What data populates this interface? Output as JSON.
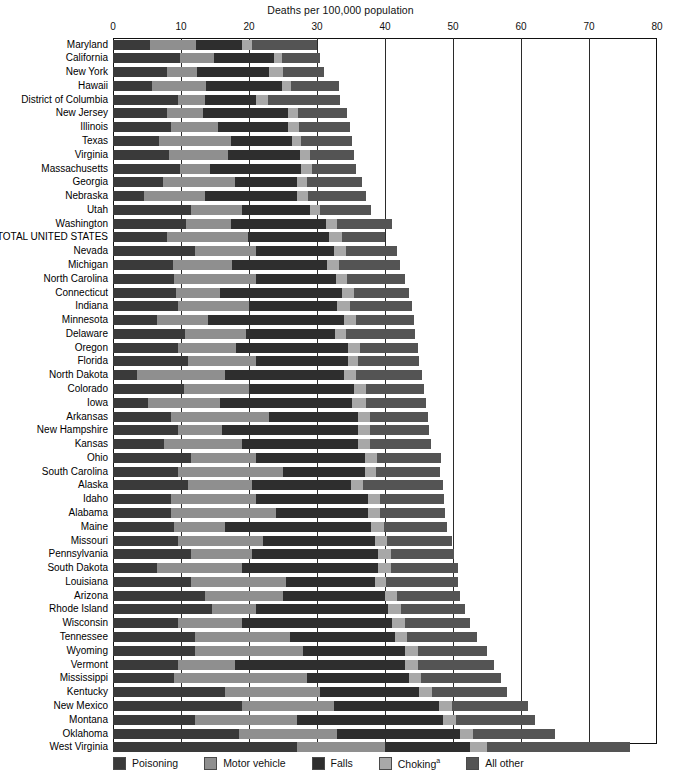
{
  "chart_data": {
    "type": "bar",
    "orientation": "horizontal",
    "stacked": true,
    "title": "Deaths per 100,000 population",
    "xlabel": "Deaths per 100,000 population",
    "ylabel": "",
    "xlim": [
      0,
      80
    ],
    "xticks": [
      0,
      10,
      20,
      30,
      40,
      50,
      60,
      70,
      80
    ],
    "grid": "vertical",
    "legend_position": "bottom",
    "legend": [
      {
        "name": "Poisoning",
        "color": "#3a3a3a"
      },
      {
        "name": "Motor vehicle",
        "color": "#8f8f8f"
      },
      {
        "name": "Falls",
        "color": "#2e2e2e"
      },
      {
        "name": "Choking",
        "color": "#a8a8a8",
        "footnote": "a"
      },
      {
        "name": "All other",
        "color": "#545454"
      }
    ],
    "series": [
      {
        "name": "Poisoning",
        "color": "#3a3a3a"
      },
      {
        "name": "Motor vehicle",
        "color": "#8f8f8f"
      },
      {
        "name": "Falls",
        "color": "#2e2e2e"
      },
      {
        "name": "Choking",
        "color": "#a8a8a8"
      },
      {
        "name": "All other",
        "color": "#545454"
      }
    ],
    "categories": [
      "Maryland",
      "California",
      "New York",
      "Hawaii",
      "District of Columbia",
      "New Jersey",
      "Illinois",
      "Texas",
      "Virginia",
      "Massachusetts",
      "Georgia",
      "Nebraska",
      "Utah",
      "Washington",
      "TOTAL UNITED STATES",
      "Nevada",
      "Michigan",
      "North Carolina",
      "Connecticut",
      "Indiana",
      "Minnesota",
      "Delaware",
      "Oregon",
      "Florida",
      "North Dakota",
      "Colorado",
      "Iowa",
      "Arkansas",
      "New Hampshire",
      "Kansas",
      "Ohio",
      "South Carolina",
      "Alaska",
      "Idaho",
      "Alabama",
      "Maine",
      "Missouri",
      "Pennsylvania",
      "South Dakota",
      "Louisiana",
      "Arizona",
      "Rhode Island",
      "Wisconsin",
      "Tennessee",
      "Wyoming",
      "Vermont",
      "Mississippi",
      "Kentucky",
      "New Mexico",
      "Montana",
      "Oklahoma",
      "West Virginia"
    ],
    "rows": [
      {
        "state": "Maryland",
        "values": [
          5.4,
          6.8,
          6.8,
          1.5,
          9.5
        ],
        "total": 30.0
      },
      {
        "state": "California",
        "values": [
          9.9,
          4.9,
          8.9,
          1.2,
          5.6
        ],
        "total": 30.5
      },
      {
        "state": "New York",
        "values": [
          8.0,
          4.3,
          10.7,
          2.0,
          6.0
        ],
        "total": 31.0
      },
      {
        "state": "Hawaii",
        "values": [
          5.7,
          8.0,
          11.2,
          1.3,
          7.0
        ],
        "total": 33.2
      },
      {
        "state": "District of Columbia",
        "values": [
          9.5,
          4.0,
          7.5,
          1.8,
          10.6
        ],
        "total": 33.4
      },
      {
        "state": "New Jersey",
        "values": [
          7.9,
          5.4,
          12.5,
          1.4,
          7.2
        ],
        "total": 34.4
      },
      {
        "state": "Illinois",
        "values": [
          8.5,
          7.0,
          10.2,
          1.6,
          7.5
        ],
        "total": 34.8
      },
      {
        "state": "Texas",
        "values": [
          6.8,
          10.5,
          9.0,
          1.3,
          7.6
        ],
        "total": 35.2
      },
      {
        "state": "Virginia",
        "values": [
          8.2,
          8.7,
          10.6,
          1.5,
          6.5
        ],
        "total": 35.5
      },
      {
        "state": "Massachusetts",
        "values": [
          9.8,
          4.5,
          13.4,
          1.6,
          6.5
        ],
        "total": 35.8
      },
      {
        "state": "Georgia",
        "values": [
          7.4,
          10.5,
          9.2,
          1.5,
          8.0
        ],
        "total": 36.6
      },
      {
        "state": "Nebraska",
        "values": [
          4.5,
          9.0,
          13.5,
          1.7,
          8.5
        ],
        "total": 37.2
      },
      {
        "state": "Utah",
        "values": [
          11.5,
          7.5,
          10.0,
          1.5,
          7.5
        ],
        "total": 38.0
      },
      {
        "state": "Washington",
        "values": [
          10.8,
          6.5,
          14.0,
          1.6,
          8.2
        ],
        "total": 41.1
      },
      {
        "state": "TOTAL UNITED STATES",
        "values": [
          8.0,
          11.8,
          12.0,
          1.9,
          6.3
        ],
        "total": 40.0
      },
      {
        "state": "Nevada",
        "values": [
          12.0,
          9.0,
          11.5,
          1.8,
          7.5
        ],
        "total": 41.8
      },
      {
        "state": "Michigan",
        "values": [
          8.8,
          8.7,
          14.0,
          1.7,
          9.0
        ],
        "total": 42.2
      },
      {
        "state": "North Carolina",
        "values": [
          9.0,
          12.0,
          11.8,
          1.6,
          8.6
        ],
        "total": 43.0
      },
      {
        "state": "Connecticut",
        "values": [
          9.2,
          6.5,
          18.0,
          1.7,
          8.1
        ],
        "total": 43.5
      },
      {
        "state": "Indiana",
        "values": [
          9.5,
          10.5,
          13.0,
          1.8,
          9.2
        ],
        "total": 44.0
      },
      {
        "state": "Minnesota",
        "values": [
          6.5,
          7.5,
          20.0,
          1.8,
          8.4
        ],
        "total": 44.2
      },
      {
        "state": "Delaware",
        "values": [
          10.6,
          9.0,
          13.0,
          1.6,
          10.2
        ],
        "total": 44.4
      },
      {
        "state": "Oregon",
        "values": [
          9.6,
          8.5,
          16.5,
          1.7,
          8.5
        ],
        "total": 44.8
      },
      {
        "state": "Florida",
        "values": [
          11.0,
          10.0,
          13.5,
          1.6,
          8.9
        ],
        "total": 45.0
      },
      {
        "state": "North Dakota",
        "values": [
          3.5,
          13.0,
          17.5,
          1.8,
          9.7
        ],
        "total": 45.5
      },
      {
        "state": "Colorado",
        "values": [
          10.5,
          9.5,
          15.5,
          1.7,
          8.6
        ],
        "total": 45.8
      },
      {
        "state": "Iowa",
        "values": [
          5.2,
          10.5,
          19.5,
          2.0,
          8.9
        ],
        "total": 46.1
      },
      {
        "state": "Arkansas",
        "values": [
          8.5,
          14.5,
          13.0,
          1.8,
          8.5
        ],
        "total": 46.3
      },
      {
        "state": "New Hampshire",
        "values": [
          9.5,
          6.5,
          20.0,
          1.8,
          8.7
        ],
        "total": 46.5
      },
      {
        "state": "Kansas",
        "values": [
          7.5,
          11.5,
          17.0,
          1.8,
          9.0
        ],
        "total": 46.8
      },
      {
        "state": "Ohio",
        "values": [
          11.5,
          9.5,
          16.0,
          1.8,
          9.5
        ],
        "total": 48.3
      },
      {
        "state": "South Carolina",
        "values": [
          9.5,
          15.5,
          12.0,
          1.7,
          9.4
        ],
        "total": 48.1
      },
      {
        "state": "Alaska",
        "values": [
          11.0,
          9.5,
          14.5,
          1.7,
          11.8
        ],
        "total": 48.5
      },
      {
        "state": "Idaho",
        "values": [
          8.5,
          12.5,
          16.5,
          1.8,
          9.4
        ],
        "total": 48.7
      },
      {
        "state": "Alabama",
        "values": [
          8.5,
          15.5,
          13.5,
          1.7,
          9.6
        ],
        "total": 48.8
      },
      {
        "state": "Maine",
        "values": [
          9.0,
          7.5,
          21.5,
          1.8,
          9.3
        ],
        "total": 49.1
      },
      {
        "state": "Missouri",
        "values": [
          9.5,
          12.5,
          16.5,
          1.8,
          9.5
        ],
        "total": 49.8
      },
      {
        "state": "Pennsylvania",
        "values": [
          11.5,
          9.0,
          18.5,
          1.9,
          9.3
        ],
        "total": 50.2
      },
      {
        "state": "South Dakota",
        "values": [
          6.5,
          12.5,
          20.0,
          1.9,
          9.8
        ],
        "total": 50.7
      },
      {
        "state": "Louisiana",
        "values": [
          11.5,
          14.0,
          13.0,
          1.7,
          10.5
        ],
        "total": 50.7
      },
      {
        "state": "Arizona",
        "values": [
          13.5,
          11.5,
          15.0,
          1.7,
          9.3
        ],
        "total": 51.0
      },
      {
        "state": "Rhode Island",
        "values": [
          14.5,
          6.5,
          19.5,
          1.8,
          9.5
        ],
        "total": 51.8
      },
      {
        "state": "Wisconsin",
        "values": [
          9.5,
          9.5,
          22.0,
          1.9,
          9.6
        ],
        "total": 52.5
      },
      {
        "state": "Tennessee",
        "values": [
          12.0,
          14.0,
          15.5,
          1.8,
          10.2
        ],
        "total": 53.5
      },
      {
        "state": "Wyoming",
        "values": [
          12.0,
          16.0,
          15.0,
          1.8,
          10.2
        ],
        "total": 55.0
      },
      {
        "state": "Vermont",
        "values": [
          9.5,
          8.5,
          25.0,
          1.9,
          11.1
        ],
        "total": 56.0
      },
      {
        "state": "Mississippi",
        "values": [
          9.0,
          19.5,
          15.0,
          1.8,
          11.7
        ],
        "total": 57.0
      },
      {
        "state": "Kentucky",
        "values": [
          16.5,
          14.0,
          14.5,
          1.9,
          11.1
        ],
        "total": 58.0
      },
      {
        "state": "New Mexico",
        "values": [
          19.0,
          13.5,
          15.5,
          1.8,
          11.2
        ],
        "total": 61.0
      },
      {
        "state": "Montana",
        "values": [
          12.0,
          15.0,
          21.5,
          1.9,
          11.6
        ],
        "total": 62.0
      },
      {
        "state": "Oklahoma",
        "values": [
          18.5,
          14.5,
          18.0,
          2.0,
          12.0
        ],
        "total": 65.0
      },
      {
        "state": "West Virginia",
        "values": [
          27.0,
          13.0,
          12.5,
          2.5,
          21.0
        ],
        "total": 76.0
      }
    ]
  },
  "legend": {
    "items": [
      {
        "label": "Poisoning",
        "footnote": "",
        "color": "#3a3a3a"
      },
      {
        "label": "Motor vehicle",
        "footnote": "",
        "color": "#8f8f8f"
      },
      {
        "label": "Falls",
        "footnote": "",
        "color": "#2e2e2e"
      },
      {
        "label": "Choking",
        "footnote": "a",
        "color": "#a8a8a8"
      },
      {
        "label": "All other",
        "footnote": "",
        "color": "#545454"
      }
    ]
  }
}
